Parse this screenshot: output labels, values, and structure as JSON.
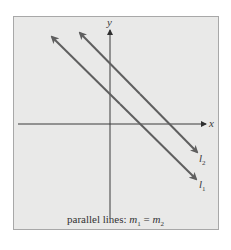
{
  "diagram": {
    "axes": {
      "x_label": "x",
      "y_label": "y"
    },
    "lines": [
      {
        "name": "l",
        "subscript": "1",
        "label": "l1"
      },
      {
        "name": "l",
        "subscript": "2",
        "label": "l2"
      }
    ],
    "caption": {
      "prefix": "parallel lines: ",
      "m": "m",
      "sub1": "1",
      "eq": " = ",
      "sub2": "2"
    },
    "colors": {
      "background": "#e9e9e8",
      "line": "#5f5f5f",
      "axis": "#3a3a3a",
      "border": "#a8a8a8"
    }
  }
}
